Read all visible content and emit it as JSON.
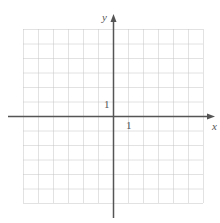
{
  "diagram": {
    "type": "coordinate-grid",
    "grid": {
      "columns": 12,
      "rows": 12,
      "line_style": "dotted",
      "color": "#c8c8c8"
    },
    "axes": {
      "x_label": "x",
      "y_label": "y",
      "color": "#555555"
    },
    "tick_labels": {
      "x_unit": "1",
      "y_unit": "1"
    }
  }
}
